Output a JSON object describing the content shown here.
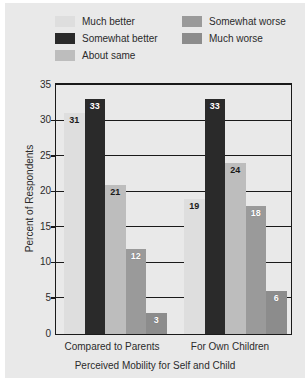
{
  "chart_data": {
    "type": "bar",
    "title": "",
    "xlabel": "Perceived Mobility for Self and Child",
    "ylabel": "Percent of Respondents",
    "categories": [
      "Compared to Parents",
      "For Own Children"
    ],
    "ylim": [
      0,
      35
    ],
    "yticks": [
      0,
      5,
      10,
      15,
      20,
      25,
      30,
      35
    ],
    "grid": true,
    "legend_position": "top",
    "series": [
      {
        "name": "Much better",
        "color": "#dedede",
        "values": [
          31,
          19
        ],
        "label_color": "dark"
      },
      {
        "name": "Somewhat better",
        "color": "#2a2a2a",
        "values": [
          33,
          33
        ],
        "label_color": "light"
      },
      {
        "name": "About same",
        "color": "#bdbdbd",
        "values": [
          21,
          24
        ],
        "label_color": "dark"
      },
      {
        "name": "Somewhat worse",
        "color": "#9a9a9a",
        "values": [
          12,
          18
        ],
        "label_color": "light"
      },
      {
        "name": "Much worse",
        "color": "#8c8c8c",
        "values": [
          3,
          6
        ],
        "label_color": "light"
      }
    ]
  },
  "legend": {
    "left_column": [
      "Much better",
      "Somewhat better",
      "About same"
    ],
    "right_column": [
      "Somewhat worse",
      "Much worse"
    ]
  },
  "axis": {
    "y_tick_labels": [
      "35",
      "30",
      "25",
      "20",
      "15",
      "10",
      "5",
      "0"
    ],
    "y_axis_title": "Percent of Respondents",
    "x_axis_title": "Perceived Mobility for Self and Child",
    "x_group_labels": [
      "Compared to Parents",
      "For Own Children"
    ]
  },
  "values_text": {
    "g1": [
      "31",
      "33",
      "21",
      "12",
      "3"
    ],
    "g2": [
      "19",
      "33",
      "24",
      "18",
      "6"
    ]
  },
  "colors": {
    "figure_background": "#e9e9e9",
    "page_background": "#ffffff",
    "axis_line": "#1a1a1a",
    "text": "#2b2b2b"
  }
}
